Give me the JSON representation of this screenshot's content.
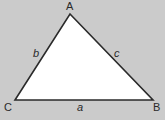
{
  "diagram": {
    "type": "triangle",
    "colors": {
      "background": "#cbcbcb",
      "fill": "#ffffff",
      "stroke": "#2a2a2a"
    },
    "vertices": [
      {
        "label": "A",
        "x": 70,
        "y": 14
      },
      {
        "label": "B",
        "x": 153,
        "y": 100
      },
      {
        "label": "C",
        "x": 15,
        "y": 100
      }
    ],
    "sides": [
      {
        "label": "a",
        "between": "B-C"
      },
      {
        "label": "b",
        "between": "A-C"
      },
      {
        "label": "c",
        "between": "A-B"
      }
    ]
  }
}
